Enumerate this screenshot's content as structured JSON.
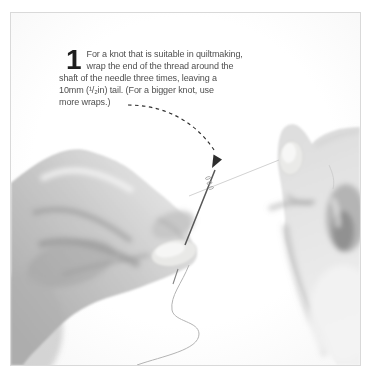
{
  "page": {
    "background_color": "#ffffff",
    "photo_frame": {
      "border_color": "#d9d9d9",
      "background_color": "#ffffff"
    }
  },
  "step": {
    "number": "1",
    "lines": [
      "For a knot that is suitable in quiltmaking,",
      "wrap the end of the thread around the",
      "shaft of the needle three times, leaving a",
      "10mm (¹/₂in) tail. (For a bigger knot, use",
      "more wraps.)"
    ]
  },
  "figure": {
    "type": "grayscale-photo",
    "alt": "Left hand pinching an upright sewing needle with thread wrapped around its shaft; right hand pulls the thread up to the right; a loose thread tail hangs in an S-curve below; a dashed arrow points from the caption to the wraps at the top of the needle"
  },
  "colors": {
    "text": "#4f4f4f",
    "step_number": "#1e1e1e",
    "arrow_ink": "#2e2e2e",
    "needle": "#575757",
    "thread": "#c6c6c6",
    "hanging_thread": "#b3b3b3",
    "hand_shadow": "#8f8f8f",
    "hand_light": "#efefef"
  }
}
